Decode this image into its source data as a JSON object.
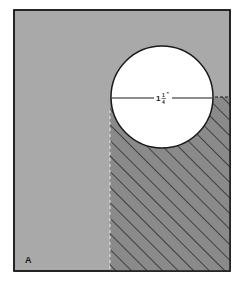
{
  "figure": {
    "panel_label": "A",
    "dimension_label": "1¼\"",
    "dimension_whole": "1",
    "dimension_num": "1",
    "dimension_den": "4",
    "dimension_mark": "\"",
    "colors": {
      "background": "#ffffff",
      "panel_fill": "#a9a9a9",
      "hatch_fill": "#8a8a8a",
      "hatch_stroke": "#2b2b2b",
      "circle_fill": "#ffffff",
      "outline": "#1a1a1a"
    }
  }
}
